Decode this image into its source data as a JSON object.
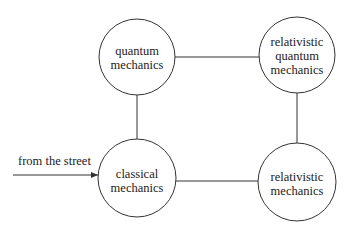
{
  "diagram": {
    "nodes": [
      {
        "id": "quantum",
        "lines": [
          "quantum",
          "mechanics"
        ],
        "cx": 137,
        "cy": 57,
        "r": 38
      },
      {
        "id": "relativistic-quantum",
        "lines": [
          "relativistic",
          "quantum",
          "mechanics"
        ],
        "cx": 297,
        "cy": 55,
        "r": 38
      },
      {
        "id": "classical",
        "lines": [
          "classical",
          "mechanics"
        ],
        "cx": 137,
        "cy": 178,
        "r": 39
      },
      {
        "id": "relativistic",
        "lines": [
          "relativistic",
          "mechanics"
        ],
        "cx": 297,
        "cy": 182,
        "r": 39
      }
    ],
    "edges": [
      {
        "from": "quantum",
        "to": "relativistic-quantum"
      },
      {
        "from": "quantum",
        "to": "classical"
      },
      {
        "from": "relativistic-quantum",
        "to": "relativistic"
      },
      {
        "from": "classical",
        "to": "relativistic"
      }
    ],
    "entry_arrow": {
      "label": "from the street",
      "to": "classical"
    },
    "colors": {
      "stroke": "#333333",
      "text": "#222222",
      "background": "#ffffff"
    }
  }
}
